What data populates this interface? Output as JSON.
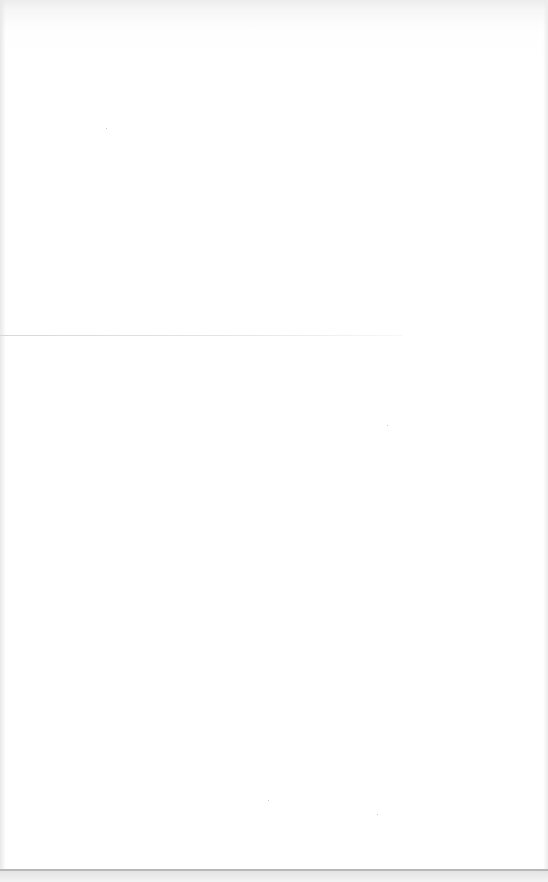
{
  "document": {
    "type": "scanned blank page",
    "text": ""
  }
}
